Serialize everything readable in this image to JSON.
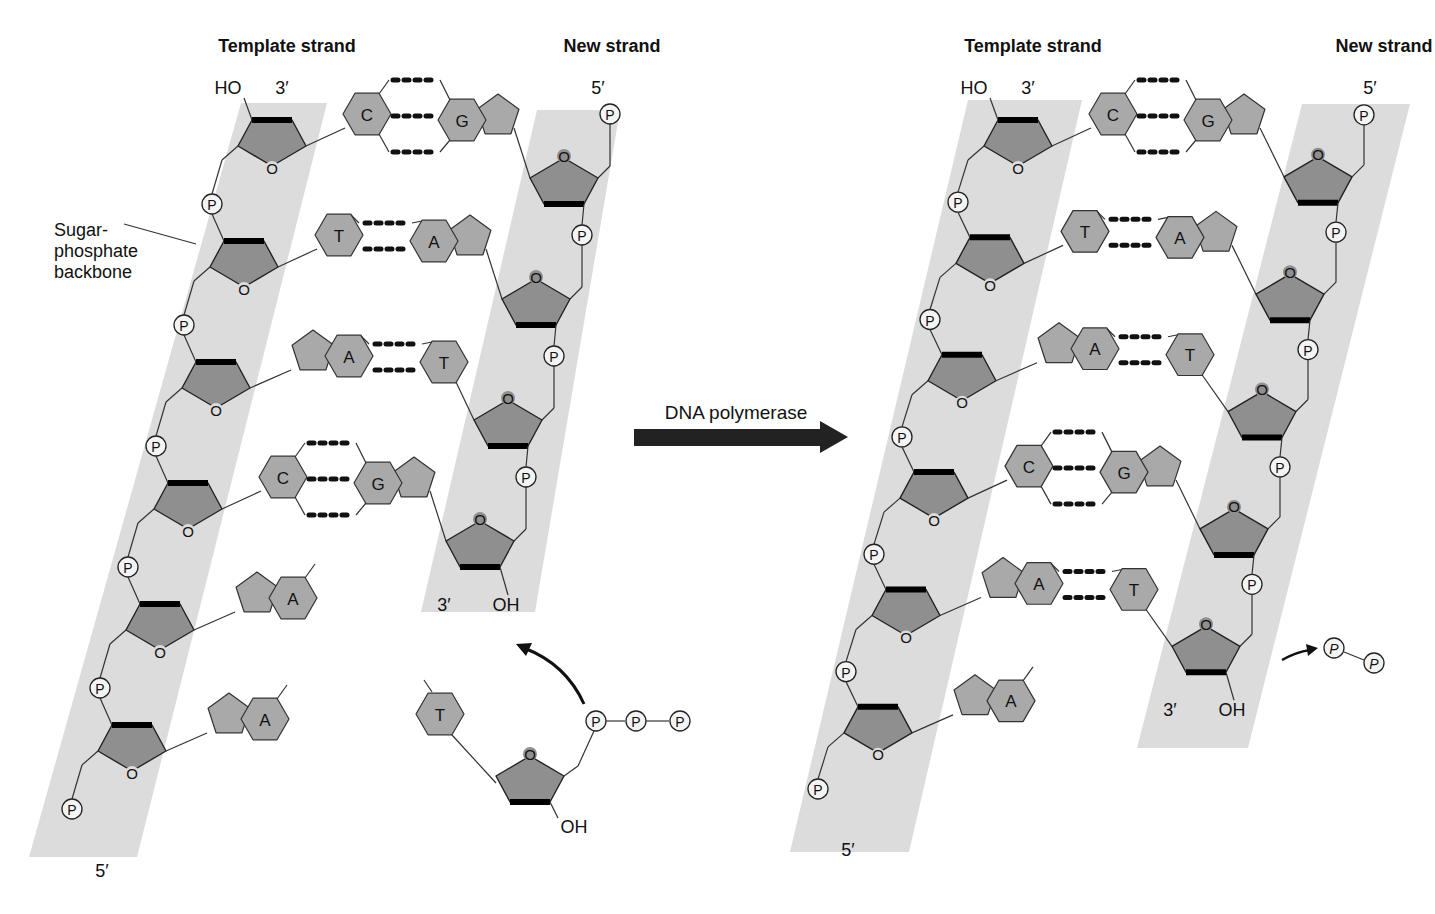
{
  "diagram": {
    "colors": {
      "backbone_band": "#dcdcdc",
      "sugar_fill": "#8f8f8f",
      "base_fill": "#a9a9a9",
      "phosphate_fill": "#f4f4f4",
      "arrow": "#222222"
    },
    "process_arrow": {
      "label": "DNA polymerase",
      "icon": "right-arrow-icon"
    },
    "left_panel": {
      "template_label": "Template strand",
      "new_label": "New strand",
      "template_top_end": "3′",
      "template_top_group": "HO",
      "template_bottom_end": "5′",
      "new_top_end": "5′",
      "new_bottom_end": "3′",
      "new_bottom_group": "OH",
      "backbone_callout": [
        "Sugar-",
        "phosphate",
        "backbone"
      ],
      "base_pairs": [
        {
          "template": "C",
          "new": "G",
          "hbonds": 3
        },
        {
          "template": "T",
          "new": "A",
          "hbonds": 2
        },
        {
          "template": "A",
          "new": "T",
          "hbonds": 2
        },
        {
          "template": "C",
          "new": "G",
          "hbonds": 3
        }
      ],
      "unpaired_template_bases": [
        "A",
        "A"
      ],
      "incoming_nucleotide": {
        "base": "T",
        "phosphates": [
          "P",
          "P",
          "P"
        ],
        "hydroxyl": "OH"
      }
    },
    "right_panel": {
      "template_label": "Template strand",
      "new_label": "New strand",
      "template_top_end": "3′",
      "template_top_group": "HO",
      "template_bottom_end": "5′",
      "new_top_end": "5′",
      "new_bottom_end": "3′",
      "new_bottom_group": "OH",
      "base_pairs": [
        {
          "template": "C",
          "new": "G",
          "hbonds": 3
        },
        {
          "template": "T",
          "new": "A",
          "hbonds": 2
        },
        {
          "template": "A",
          "new": "T",
          "hbonds": 2
        },
        {
          "template": "C",
          "new": "G",
          "hbonds": 3
        },
        {
          "template": "A",
          "new": "T",
          "hbonds": 2
        }
      ],
      "unpaired_template_bases": [
        "A"
      ],
      "released_pyrophosphate": [
        "P",
        "P"
      ]
    },
    "phosphate_symbol": "P",
    "ring_oxygen": "O"
  }
}
